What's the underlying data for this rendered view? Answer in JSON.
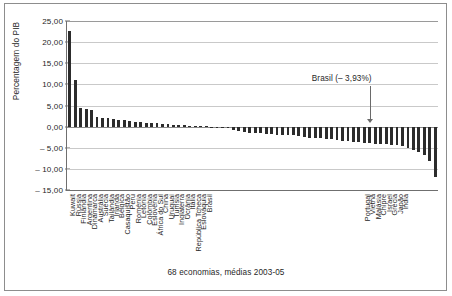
{
  "figure": {
    "caption": "68 economias, médias 2003-05",
    "frame_color": "#8d8d8d",
    "background": "#ffffff"
  },
  "annotation": {
    "text": "Brasil (– 3,93%)",
    "target_category": "Brasil",
    "target_value": -3.93
  },
  "chart_data": {
    "type": "bar",
    "title": "",
    "subtitle": "",
    "xlabel": "68 economias, médias 2003-05",
    "ylabel": "Percentagem do PIB",
    "ylim": [
      -15,
      25
    ],
    "ytick_labels": [
      "25,00",
      "20,00",
      "15,00",
      "10,00",
      "5,00",
      "0,00",
      "– 5,00",
      "– 10,00",
      "– 15,00"
    ],
    "ytick_values": [
      25,
      20,
      15,
      10,
      5,
      0,
      -5,
      -10,
      -15
    ],
    "grid": true,
    "legend": "none",
    "bar_color": "#2c2c2c",
    "orientation": "vertical",
    "series_name": "Saldo em conta corrente",
    "categories": [
      "Kuwait",
      "Rússia",
      "Finlândia",
      "Argentina",
      "Dinamarca",
      "Austrália",
      "Suécia",
      "Tailândia",
      "Irlanda",
      "Bélgica",
      "Casaquistão",
      "Peru",
      "Roménia",
      "Letónia",
      "Colômbia",
      "Eslovênia",
      "África do Sul",
      "China",
      "Uruguai",
      "Tunísia",
      "Inglaterra",
      "Ucrânia",
      "Itália",
      "República Tcheca",
      "Eslováquia",
      "Brasil",
      "Portugal",
      "Vietnã",
      "Malásia",
      "Chipre",
      "Israel",
      "Grécia",
      "Japão",
      "Índia"
    ],
    "values": [
      22.6,
      11.0,
      4.5,
      4.1,
      4.05,
      2.3,
      2.1,
      1.95,
      1.8,
      1.65,
      1.45,
      1.3,
      1.15,
      1.05,
      0.95,
      0.85,
      0.75,
      0.65,
      0.55,
      0.45,
      0.35,
      0.28,
      0.2,
      0.14,
      0.08,
      0.04,
      0.0,
      -0.05,
      -0.1,
      -0.18,
      -0.25,
      -0.35,
      -0.45,
      -0.55
    ],
    "n_economies": 68,
    "period": "2003-05",
    "all_values": [
      22.6,
      11.0,
      4.5,
      4.1,
      4.05,
      2.3,
      2.1,
      1.95,
      1.8,
      1.65,
      1.45,
      1.3,
      1.15,
      1.05,
      0.95,
      0.85,
      0.75,
      0.65,
      0.55,
      0.45,
      0.35,
      0.28,
      0.2,
      0.14,
      0.08,
      0.04,
      0.0,
      -0.05,
      -0.1,
      -0.18,
      -0.9,
      -1.15,
      -1.3,
      -1.4,
      -1.5,
      -1.6,
      -1.7,
      -1.8,
      -1.9,
      -1.95,
      -2.0,
      -2.1,
      -2.3,
      -2.5,
      -2.6,
      -2.7,
      -2.8,
      -2.9,
      -3.0,
      -3.1,
      -3.3,
      -3.45,
      -3.6,
      -3.75,
      -3.85,
      -3.93,
      -4.0,
      -4.1,
      -4.2,
      -4.3,
      -4.45,
      -4.6,
      -5.0,
      -5.6,
      -6.1,
      -6.6,
      -8.2,
      -11.9
    ],
    "all_categories_order": "sorted descending by current account balance",
    "labeled_tick_positions": [
      0,
      1,
      2,
      3,
      4,
      5,
      6,
      7,
      8,
      9,
      10,
      11,
      12,
      13,
      14,
      15,
      16,
      17,
      18,
      19,
      20,
      21,
      22,
      23,
      24,
      25,
      54,
      55,
      56,
      57,
      58,
      59,
      60,
      61,
      62,
      63,
      64,
      65,
      66,
      67
    ],
    "labels_shown": [
      "Kuwait",
      "Rússia",
      "Finlândia",
      "Argentina",
      "Dinamarca",
      "Austrália",
      "Suécia",
      "Tailândia",
      "Irlanda",
      "Bélgica",
      "Casaquistão",
      "Peru",
      "Roménia",
      "Letónia",
      "Colômbia",
      "Eslovênia",
      "África do Sul",
      "China",
      "Uruguai",
      "Tunísia",
      "Inglaterra",
      "Ucrânia",
      "Itália",
      "República Tcheca",
      "Eslováquia",
      "Brasil",
      "Portugal",
      "Vietnã",
      "Malásia",
      "Chipre",
      "Israel",
      "Grécia",
      "Japão",
      "Índia"
    ]
  },
  "axis": {
    "y_title": "Percentagem do PIB"
  }
}
